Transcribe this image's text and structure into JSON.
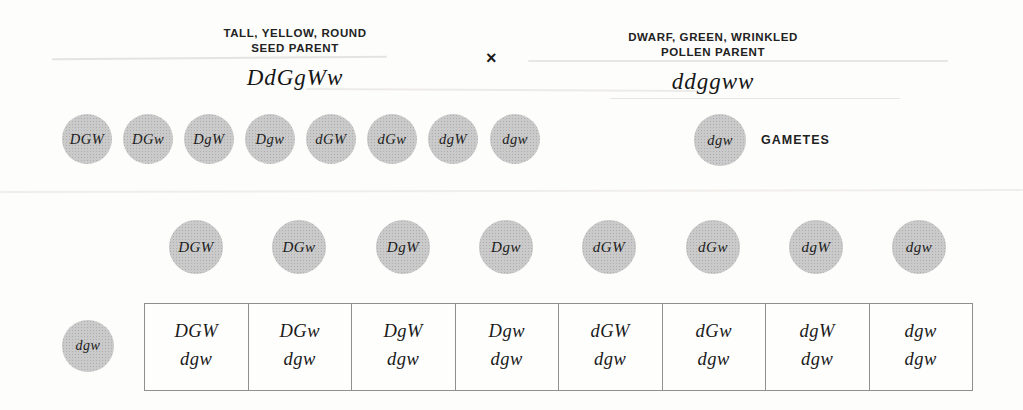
{
  "palette": {
    "circle_fill": "#cacaca",
    "circle_stipple": "#aeaeae",
    "ink": "#1e1e1e",
    "table_border": "#8f8f8f",
    "background": "#fdfdfc"
  },
  "seed_parent": {
    "trait_line": "TALL, YELLOW, ROUND",
    "role_line": "SEED PARENT",
    "genotype": "DdGgWw"
  },
  "pollen_parent": {
    "trait_line": "DWARF, GREEN, WRINKLED",
    "role_line": "POLLEN PARENT",
    "genotype": "ddggww"
  },
  "cross_symbol": "×",
  "gametes_label": "GAMETES",
  "seed_gametes": [
    "DGW",
    "DGw",
    "DgW",
    "Dgw",
    "dGW",
    "dGw",
    "dgW",
    "dgw"
  ],
  "pollen_gamete": "dgw",
  "offspring_gametes": [
    "DGW",
    "DGw",
    "DgW",
    "Dgw",
    "dGW",
    "dGw",
    "dgW",
    "dgw"
  ],
  "punnett": {
    "row_gamete": "dgw",
    "cells": [
      {
        "top": "DGW",
        "bottom": "dgw"
      },
      {
        "top": "DGw",
        "bottom": "dgw"
      },
      {
        "top": "DgW",
        "bottom": "dgw"
      },
      {
        "top": "Dgw",
        "bottom": "dgw"
      },
      {
        "top": "dGW",
        "bottom": "dgw"
      },
      {
        "top": "dGw",
        "bottom": "dgw"
      },
      {
        "top": "dgW",
        "bottom": "dgw"
      },
      {
        "top": "dgw",
        "bottom": "dgw"
      }
    ]
  }
}
